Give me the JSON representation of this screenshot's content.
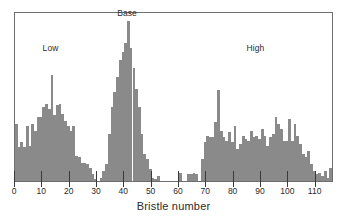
{
  "figure": {
    "background_color": "#ffffff",
    "frame_color": "#6e6e6e",
    "bar_color": "#8a8a8a",
    "xlabel": "Bristle number"
  },
  "annotations": [
    {
      "name": "low",
      "text": "Low"
    },
    {
      "name": "base",
      "text": "Base"
    },
    {
      "name": "high",
      "text": "High"
    }
  ],
  "chart_data": {
    "type": "bar",
    "title": "",
    "subtitle": "",
    "xlabel": "Bristle number",
    "ylabel": "",
    "xlim": [
      0,
      116
    ],
    "ylim": [
      0,
      100
    ],
    "grid": false,
    "legend": false,
    "bin_width": 1,
    "annotations": [
      {
        "label": "Low",
        "x": 13,
        "y": 76
      },
      {
        "label": "Base",
        "x": 41,
        "y": 97
      },
      {
        "label": "High",
        "x": 88,
        "y": 76
      }
    ],
    "tick_labels": [
      "0",
      "10",
      "20",
      "30",
      "40",
      "50",
      "60",
      "70",
      "80",
      "90",
      "100",
      "110"
    ],
    "ticks": [
      0,
      10,
      20,
      30,
      40,
      50,
      60,
      70,
      80,
      90,
      100,
      110
    ],
    "x": [
      0,
      1,
      2,
      3,
      4,
      5,
      6,
      7,
      8,
      9,
      10,
      11,
      12,
      13,
      14,
      15,
      16,
      17,
      18,
      19,
      20,
      21,
      22,
      23,
      24,
      25,
      26,
      27,
      28,
      29,
      30,
      31,
      32,
      33,
      34,
      35,
      36,
      37,
      38,
      39,
      40,
      41,
      42,
      43,
      44,
      45,
      46,
      47,
      48,
      49,
      50,
      51,
      52,
      53,
      54,
      55,
      56,
      57,
      58,
      59,
      60,
      61,
      62,
      63,
      64,
      65,
      66,
      67,
      68,
      69,
      70,
      71,
      72,
      73,
      74,
      75,
      76,
      77,
      78,
      79,
      80,
      81,
      82,
      83,
      84,
      85,
      86,
      87,
      88,
      89,
      90,
      91,
      92,
      93,
      94,
      95,
      96,
      97,
      98,
      99,
      100,
      101,
      102,
      103,
      104,
      105,
      106,
      107,
      108,
      109,
      110,
      111,
      112,
      113,
      114,
      115
    ],
    "values": [
      34,
      20,
      23,
      20,
      33,
      21,
      34,
      30,
      38,
      38,
      44,
      46,
      43,
      63,
      39,
      45,
      46,
      40,
      36,
      33,
      30,
      33,
      15,
      14,
      11,
      11,
      10,
      8,
      4,
      1,
      0,
      2,
      6,
      10,
      28,
      44,
      53,
      62,
      72,
      77,
      82,
      95,
      79,
      67,
      55,
      44,
      28,
      16,
      13,
      7,
      2,
      1,
      3,
      0,
      0,
      0,
      0,
      0,
      0,
      0,
      5,
      0,
      0,
      4,
      4,
      5,
      4,
      0,
      13,
      23,
      27,
      26,
      26,
      35,
      54,
      30,
      26,
      24,
      29,
      23,
      33,
      19,
      22,
      27,
      25,
      24,
      30,
      26,
      27,
      25,
      31,
      27,
      21,
      26,
      28,
      38,
      34,
      31,
      24,
      24,
      37,
      24,
      34,
      27,
      22,
      16,
      14,
      18,
      10,
      6,
      4,
      5,
      3,
      6,
      2,
      8
    ]
  }
}
